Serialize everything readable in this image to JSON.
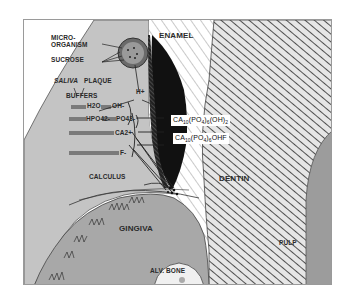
{
  "diagram": {
    "type": "anatomical-cross-section",
    "colors": {
      "background": "#ffffff",
      "frame": "#9a9a9a",
      "plaque_region": "#c4c4c4",
      "gingiva": "#a8a8a8",
      "pulp": "#9c9c9c",
      "enamel_lesion": "#111111",
      "hatch": "#555555",
      "microorganism": "#6a6a6a"
    },
    "labels": {
      "microorganism": "MICRO-\nORGANISM",
      "microorganism_line1": "MICRO-",
      "microorganism_line2": "ORGANISM",
      "sucrose": "SUCROSE",
      "saliva": "SALIVA",
      "plaque": "PLAQUE",
      "buffers": "BUFFERS",
      "h_plus": "H+",
      "h2o": "H2O",
      "oh_minus": "OH-",
      "hpo4": "HPO42-",
      "po4": "PO43-",
      "ca2plus": "CA2+",
      "f_minus": "F-",
      "calculus": "CALCULUS",
      "enamel": "ENAMEL",
      "dentin": "DENTIN",
      "gingiva": "GINGIVA",
      "pulp": "PULP",
      "alv_bone": "ALV. BONE"
    },
    "formulas": {
      "hydroxyapatite": {
        "ca": "CA",
        "ca_sub": "10",
        "po4_open": "(PO",
        "po4_sub": "4",
        "po4_close": ")",
        "mult_sub": "6",
        "oh": "(OH)",
        "oh_sub": "2",
        "text": "CA10(PO4)6(OH)2"
      },
      "fluorhydroxyapatite": {
        "ca": "CA",
        "ca_sub": "10",
        "po4_open": "(PO",
        "po4_sub": "4",
        "po4_close": ")",
        "mult_sub": "6",
        "tail": "OHF",
        "text": "CA10(PO4)6OHF"
      }
    }
  }
}
